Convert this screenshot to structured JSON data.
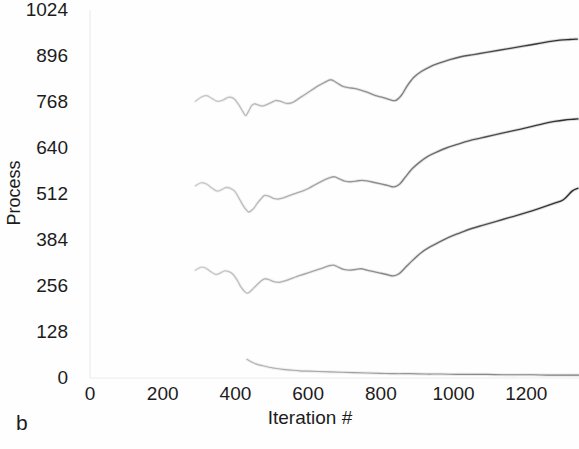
{
  "figure": {
    "panel_label": "b",
    "background": "#fefefe",
    "ink_color": "#1c1c1c"
  },
  "chart_data": {
    "type": "line",
    "title": "",
    "subtitle": "",
    "xlabel": "Iteration #",
    "ylabel": "Process",
    "xlim": [
      0,
      1345
    ],
    "ylim": [
      0,
      1024
    ],
    "xticks": [
      0,
      200,
      400,
      600,
      800,
      1000,
      1200
    ],
    "xtick_labels": [
      "0",
      "200",
      "400",
      "600",
      "800",
      "1000",
      "1200"
    ],
    "yticks": [
      0,
      128,
      256,
      384,
      512,
      640,
      768,
      896,
      1024
    ],
    "ytick_labels": [
      "0",
      "128",
      "256",
      "384",
      "512",
      "640",
      "768",
      "896",
      "1024"
    ],
    "grid": false,
    "legend": null,
    "legend_position": "none",
    "annotations": [
      "b"
    ],
    "line_color": "#7a7a7a",
    "line_color_dark": "#2a2a2a",
    "series": [
      {
        "name": "trace-1-upper",
        "color": "#6f6f6f",
        "x": [
          290,
          305,
          320,
          335,
          350,
          365,
          380,
          395,
          408,
          420,
          428,
          436,
          444,
          452,
          462,
          474,
          486,
          498,
          510,
          524,
          540,
          556,
          572,
          590,
          608,
          626,
          644,
          662,
          678,
          694,
          710,
          726,
          742,
          760,
          780,
          800,
          820,
          840,
          856,
          872,
          890,
          910,
          935,
          960,
          990,
          1020,
          1055,
          1090,
          1125,
          1160,
          1195,
          1230,
          1262,
          1292,
          1320,
          1340
        ],
        "y": [
          770,
          781,
          786,
          778,
          770,
          773,
          781,
          778,
          762,
          742,
          730,
          742,
          757,
          763,
          760,
          757,
          761,
          766,
          772,
          770,
          764,
          766,
          776,
          788,
          800,
          812,
          822,
          830,
          822,
          812,
          808,
          806,
          802,
          796,
          788,
          782,
          776,
          772,
          786,
          812,
          836,
          852,
          866,
          876,
          886,
          894,
          900,
          906,
          912,
          918,
          924,
          930,
          936,
          940,
          942,
          943
        ]
      },
      {
        "name": "trace-2-middle",
        "color": "#6f6f6f",
        "x": [
          290,
          305,
          320,
          336,
          350,
          362,
          374,
          386,
          398,
          410,
          420,
          428,
          436,
          444,
          452,
          460,
          470,
          480,
          492,
          504,
          518,
          534,
          550,
          566,
          584,
          602,
          620,
          638,
          656,
          672,
          686,
          700,
          716,
          732,
          748,
          764,
          782,
          800,
          818,
          836,
          852,
          868,
          886,
          906,
          928,
          952,
          980,
          1010,
          1042,
          1076,
          1110,
          1146,
          1182,
          1216,
          1248,
          1278,
          1306,
          1330,
          1342
        ],
        "y": [
          535,
          543,
          540,
          528,
          520,
          524,
          530,
          528,
          520,
          500,
          482,
          470,
          462,
          466,
          474,
          486,
          498,
          508,
          506,
          500,
          498,
          502,
          508,
          514,
          520,
          528,
          538,
          548,
          556,
          560,
          554,
          548,
          546,
          548,
          550,
          548,
          544,
          540,
          536,
          532,
          540,
          560,
          582,
          600,
          616,
          628,
          640,
          650,
          660,
          668,
          676,
          684,
          692,
          700,
          708,
          714,
          718,
          720,
          721
        ]
      },
      {
        "name": "trace-3-lower",
        "color": "#6f6f6f",
        "x": [
          290,
          304,
          318,
          332,
          346,
          358,
          370,
          382,
          394,
          406,
          416,
          424,
          432,
          440,
          448,
          458,
          468,
          480,
          492,
          506,
          520,
          536,
          552,
          568,
          586,
          604,
          622,
          640,
          656,
          670,
          684,
          698,
          714,
          730,
          746,
          762,
          780,
          798,
          816,
          834,
          850,
          868,
          888,
          910,
          934,
          960,
          988,
          1018,
          1050,
          1084,
          1118,
          1152,
          1186,
          1218,
          1248,
          1276,
          1302,
          1326,
          1342
        ],
        "y": [
          300,
          308,
          306,
          296,
          288,
          292,
          298,
          296,
          288,
          270,
          252,
          242,
          236,
          240,
          248,
          258,
          268,
          276,
          274,
          268,
          266,
          270,
          276,
          282,
          288,
          294,
          300,
          306,
          312,
          314,
          308,
          302,
          300,
          302,
          304,
          300,
          296,
          292,
          288,
          284,
          290,
          308,
          328,
          348,
          364,
          378,
          392,
          404,
          416,
          426,
          436,
          446,
          456,
          466,
          476,
          486,
          496,
          520,
          528
        ]
      },
      {
        "name": "trace-4-baseline",
        "color": "#8a8a8a",
        "x": [
          432,
          446,
          460,
          476,
          492,
          510,
          530,
          552,
          576,
          602,
          630,
          660,
          692,
          726,
          762,
          800,
          840,
          882,
          924,
          966,
          1008,
          1050,
          1092,
          1134,
          1176,
          1218,
          1258,
          1296,
          1330,
          1344
        ],
        "y": [
          52,
          44,
          38,
          34,
          30,
          27,
          24,
          22,
          20,
          19,
          18,
          17,
          16,
          15,
          14,
          13,
          12,
          12,
          11,
          11,
          10,
          10,
          10,
          9,
          9,
          9,
          8,
          8,
          8,
          8
        ]
      }
    ]
  }
}
